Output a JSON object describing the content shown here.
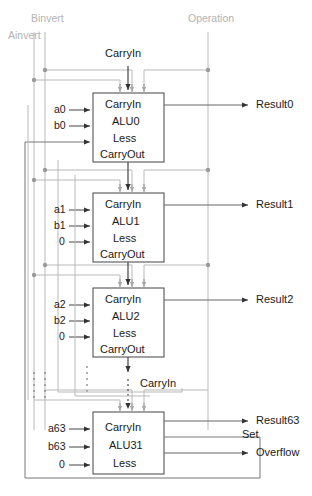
{
  "figure": {
    "type": "logic-block-diagram"
  },
  "control_signals": [
    {
      "name": "ainvert",
      "label": "Ainvert",
      "x": 8,
      "y": 34,
      "color": "#b0b0b0"
    },
    {
      "name": "binvert",
      "label": "Binvert",
      "x": 31,
      "y": 18,
      "color": "#b0b0b0"
    },
    {
      "name": "operation",
      "label": "Operation",
      "x": 188,
      "y": 18,
      "color": "#b0b0b0"
    }
  ],
  "top_carry": {
    "label": "CarryIn",
    "x": 107,
    "y": 52
  },
  "mid_carry": {
    "label": "CarryIn",
    "x": 142,
    "y": 381
  },
  "set_label": {
    "label": "Set",
    "x": 242,
    "y": 432
  },
  "slices": [
    {
      "id": "alu0",
      "box_label_lines": [
        "CarryIn",
        "ALU0",
        "Less",
        "CarryOut"
      ],
      "name": "ALU0",
      "inputs": [
        {
          "name": "a0",
          "label": "a0"
        },
        {
          "name": "b0",
          "label": "b0"
        },
        {
          "name": "less0",
          "label": ""
        }
      ],
      "outputs": [
        {
          "name": "result0",
          "label": "Result0"
        }
      ],
      "box": {
        "x": 93,
        "y": 93,
        "w": 71,
        "h": 69
      }
    },
    {
      "id": "alu1",
      "box_label_lines": [
        "CarryIn",
        "ALU1",
        "Less",
        "CarryOut"
      ],
      "name": "ALU1",
      "inputs": [
        {
          "name": "a1",
          "label": "a1"
        },
        {
          "name": "b1",
          "label": "b1"
        },
        {
          "name": "less1",
          "label": "0"
        }
      ],
      "outputs": [
        {
          "name": "result1",
          "label": "Result1"
        }
      ],
      "box": {
        "x": 93,
        "y": 193,
        "w": 71,
        "h": 69
      }
    },
    {
      "id": "alu2",
      "box_label_lines": [
        "CarryIn",
        "ALU2",
        "Less",
        "CarryOut"
      ],
      "name": "ALU2",
      "inputs": [
        {
          "name": "a2",
          "label": "a2"
        },
        {
          "name": "b2",
          "label": "b2"
        },
        {
          "name": "less2",
          "label": "0"
        }
      ],
      "outputs": [
        {
          "name": "result2",
          "label": "Result2"
        }
      ],
      "box": {
        "x": 93,
        "y": 288,
        "w": 71,
        "h": 69
      }
    },
    {
      "id": "alu31",
      "box_label_lines": [
        "CarryIn",
        "ALU31",
        "Less"
      ],
      "name": "ALU31",
      "inputs": [
        {
          "name": "a63",
          "label": "a63"
        },
        {
          "name": "b63",
          "label": "b63"
        },
        {
          "name": "less63",
          "label": "0"
        }
      ],
      "outputs": [
        {
          "name": "result63",
          "label": "Result63"
        },
        {
          "name": "set",
          "label": "Set"
        },
        {
          "name": "overflow",
          "label": "Overflow"
        }
      ],
      "box": {
        "x": 93,
        "y": 412,
        "w": 71,
        "h": 62
      }
    }
  ],
  "colors": {
    "wire_gray": "#b9b9b9",
    "wire_dark": "#8a8a8a",
    "box_stroke": "#555555",
    "text": "#1a1a1a",
    "label_gray": "#b0b0b0"
  }
}
